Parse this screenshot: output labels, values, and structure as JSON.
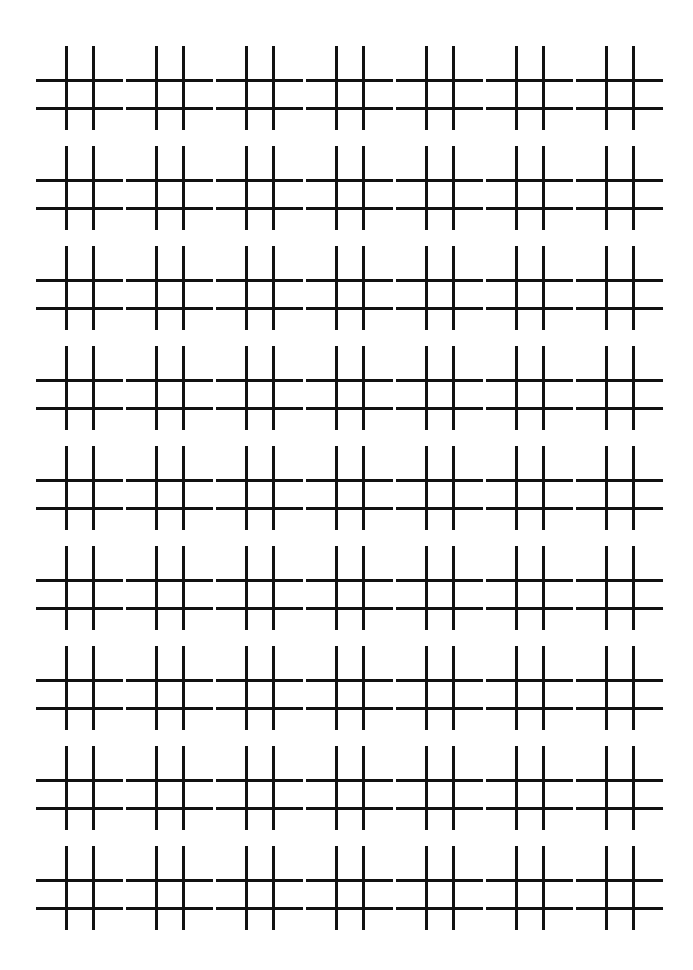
{
  "page": {
    "width": 693,
    "height": 970,
    "background_color": "#ffffff"
  },
  "pattern": {
    "name": "hash-grid",
    "glyph": "#",
    "description": "Repeating hash / number-sign tiles arranged in a regular grid",
    "columns": 7,
    "rows": 9,
    "total_cells": 63,
    "stroke_color": "#111111",
    "stroke_width": 3,
    "origin_x": 36,
    "origin_y": 46,
    "column_pitch": 90,
    "row_pitch": 100,
    "cell": {
      "vertical_offsets": [
        29,
        56
      ],
      "vertical_top": 0,
      "vertical_length": 84,
      "horizontal_offsets": [
        33,
        61
      ],
      "horizontal_left": 0,
      "horizontal_length": 87
    }
  }
}
